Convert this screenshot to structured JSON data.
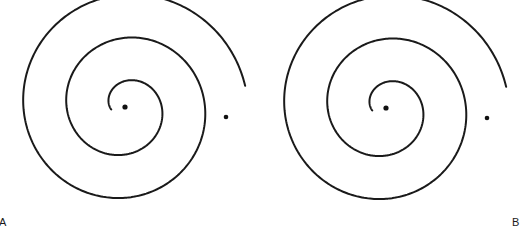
{
  "figure": {
    "background_color": "#ffffff",
    "stroke_color": "#1a1a1a",
    "stroke_width": 2,
    "width": 524,
    "height": 235,
    "panels": [
      {
        "id": "A",
        "label": "A",
        "label_x": 2,
        "label_y": 222,
        "spiral": {
          "center_x": 125,
          "center_y": 107,
          "turns": 2.5,
          "start_radius": 14,
          "end_radius": 122,
          "start_angle_deg": 170,
          "direction": "clockwise",
          "inner_tip_x": 99,
          "inner_tip_y": 99,
          "outer_tip_x": 247,
          "outer_tip_y": 118
        },
        "center_dot": {
          "x": 125,
          "y": 107,
          "r": 2.6
        },
        "outer_dot": {
          "x": 226,
          "y": 117,
          "r": 2.3
        }
      },
      {
        "id": "B",
        "label": "B",
        "label_x": 514,
        "label_y": 222,
        "spiral": {
          "center_x": 386,
          "center_y": 108,
          "turns": 2.5,
          "start_radius": 14,
          "end_radius": 122,
          "start_angle_deg": 170,
          "direction": "clockwise",
          "inner_tip_x": 359,
          "inner_tip_y": 99,
          "outer_tip_x": 508,
          "outer_tip_y": 119
        },
        "center_dot": {
          "x": 386,
          "y": 108,
          "r": 2.6
        },
        "outer_dot": {
          "x": 487,
          "y": 118,
          "r": 2.3
        }
      }
    ]
  }
}
